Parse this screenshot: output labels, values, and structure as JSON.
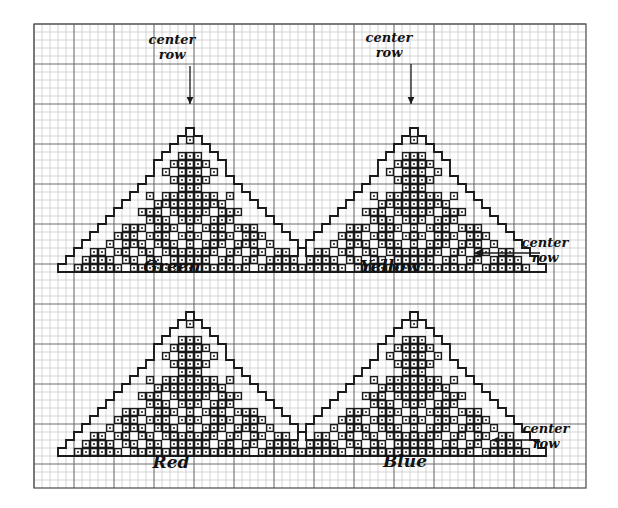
{
  "document": {
    "title": "Hand-drawn cross-stitch chart of four Christmas trees",
    "medium": "graph paper",
    "background_color": "#ffffff",
    "ink_color": "#1a1a1a",
    "grid": {
      "cell_size_px": 8,
      "minor_line_color": "#b9b9b9",
      "major_line_color": "#6e6e6e",
      "major_every": 5,
      "left_px": 34,
      "top_px": 24,
      "cols": 69,
      "rows": 58
    }
  },
  "annotations": [
    {
      "id": "center-row-green",
      "line1": "center",
      "line2": "row",
      "orientation": "vertical-arrow-down",
      "text_x": 172,
      "text_y": 44,
      "arrow": {
        "x1": 190,
        "y1": 66,
        "x2": 190,
        "y2": 104
      }
    },
    {
      "id": "center-row-yellow-top",
      "line1": "center",
      "line2": "row",
      "orientation": "vertical-arrow-down",
      "text_x": 389,
      "text_y": 42,
      "arrow": {
        "x1": 411,
        "y1": 64,
        "x2": 411,
        "y2": 104
      }
    },
    {
      "id": "center-row-yellow-right",
      "line1": "center",
      "line2": "row",
      "orientation": "horizontal-arrow-left",
      "text_x": 545,
      "text_y": 247,
      "arrow": {
        "x1": 540,
        "y1": 253,
        "x2": 474,
        "y2": 253
      }
    },
    {
      "id": "center-row-blue-right",
      "line1": "center",
      "line2": "row",
      "orientation": "horizontal-arrow-left",
      "text_x": 546,
      "text_y": 433,
      "arrow": {
        "x1": 540,
        "y1": 440,
        "x2": 492,
        "y2": 440
      }
    }
  ],
  "charts": [
    {
      "id": "tree-green",
      "label": "Green",
      "label_x": 172,
      "label_y": 272,
      "quadrant": "top-left",
      "origin_x": 34,
      "origin_y": 24,
      "apex_col": 19,
      "apex_row": 13,
      "base_row": 30,
      "half_width_cols": 15,
      "stitch_symbol": "dot",
      "notes": "Christmas tree outline with patterned stitch blocks inside"
    },
    {
      "id": "tree-yellow",
      "label": "Yellow",
      "label_x": 390,
      "label_y": 272,
      "quadrant": "top-right",
      "origin_x": 34,
      "origin_y": 24,
      "apex_col": 47,
      "apex_row": 13,
      "base_row": 30,
      "half_width_cols": 15,
      "stitch_symbol": "dot"
    },
    {
      "id": "tree-red",
      "label": "Red",
      "label_x": 171,
      "label_y": 468,
      "quadrant": "bottom-left",
      "origin_x": 34,
      "origin_y": 24,
      "apex_col": 19,
      "apex_row": 36,
      "base_row": 53,
      "half_width_cols": 15,
      "stitch_symbol": "dot"
    },
    {
      "id": "tree-blue",
      "label": "Blue",
      "label_x": 405,
      "label_y": 467,
      "quadrant": "bottom-right",
      "origin_x": 34,
      "origin_y": 24,
      "apex_col": 47,
      "apex_row": 36,
      "base_row": 53,
      "half_width_cols": 15,
      "stitch_symbol": "dot"
    }
  ],
  "chart_data": {
    "type": "table",
    "legend": [
      "Green",
      "Yellow",
      "Red",
      "Blue"
    ],
    "grid_cols": 69,
    "grid_rows": 58,
    "tree_outline_rows": [
      {
        "row": 0,
        "half": 1
      },
      {
        "row": 1,
        "half": 2
      },
      {
        "row": 2,
        "half": 3
      },
      {
        "row": 3,
        "half": 4
      },
      {
        "row": 4,
        "half": 5
      },
      {
        "row": 5,
        "half": 5
      },
      {
        "row": 6,
        "half": 6
      },
      {
        "row": 7,
        "half": 7
      },
      {
        "row": 8,
        "half": 8
      },
      {
        "row": 9,
        "half": 9
      },
      {
        "row": 10,
        "half": 10
      },
      {
        "row": 11,
        "half": 11
      },
      {
        "row": 12,
        "half": 12
      },
      {
        "row": 13,
        "half": 13
      },
      {
        "row": 14,
        "half": 14
      },
      {
        "row": 15,
        "half": 15
      },
      {
        "row": 16,
        "half": 16
      },
      {
        "row": 17,
        "half": 17
      }
    ],
    "stitch_fill": {
      "1": [
        0
      ],
      "3": [
        -1,
        0,
        1
      ],
      "4": [
        -2,
        -1,
        0,
        1,
        2
      ],
      "5": [
        -3,
        -1,
        0,
        1,
        3
      ],
      "6": [
        -2,
        -1,
        0,
        1,
        2
      ],
      "7": [
        -1,
        0,
        1
      ],
      "8": [
        -5,
        -3,
        -2,
        -1,
        0,
        1,
        2,
        3,
        5
      ],
      "9": [
        -4,
        -3,
        -2,
        -1,
        0,
        1,
        2,
        3,
        4
      ],
      "10": [
        -6,
        -5,
        -4,
        -2,
        -1,
        0,
        1,
        2,
        4,
        5,
        6
      ],
      "11": [
        -5,
        -4,
        -3,
        -1,
        0,
        1,
        3,
        4,
        5
      ],
      "12": [
        -8,
        -7,
        -6,
        -4,
        -3,
        -2,
        0,
        2,
        3,
        4,
        6,
        7,
        8
      ],
      "13": [
        -9,
        -8,
        -7,
        -5,
        -4,
        -3,
        -1,
        0,
        1,
        3,
        4,
        5,
        7,
        8,
        9
      ],
      "14": [
        -10,
        -8,
        -7,
        -6,
        -4,
        -3,
        -2,
        0,
        2,
        3,
        4,
        6,
        7,
        8,
        10
      ],
      "15": [
        -12,
        -11,
        -9,
        -8,
        -6,
        -5,
        -3,
        -2,
        -1,
        0,
        1,
        2,
        3,
        5,
        6,
        8,
        9,
        11,
        12
      ],
      "16": [
        -13,
        -12,
        -11,
        -10,
        -8,
        -7,
        -5,
        -4,
        -2,
        -1,
        0,
        1,
        2,
        4,
        5,
        7,
        8,
        10,
        11,
        12,
        13
      ],
      "17": [
        -14,
        -13,
        -12,
        -11,
        -10,
        -9,
        -7,
        -6,
        -5,
        -4,
        -3,
        -2,
        -1,
        0,
        1,
        2,
        3,
        4,
        5,
        6,
        7,
        9,
        10,
        11,
        12,
        13,
        14
      ]
    }
  }
}
